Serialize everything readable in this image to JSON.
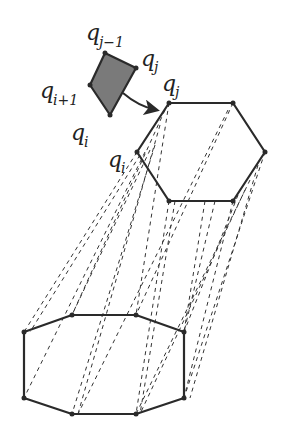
{
  "diagram": {
    "colors": {
      "stroke": "#2a2a2a",
      "fill_quad": "#7a7a7a",
      "background": "#ffffff"
    },
    "labels": {
      "q_j_minus_1": {
        "base": "q",
        "sub": "j−1"
      },
      "q_j_small": {
        "base": "q",
        "sub": "j"
      },
      "q_i_plus_1": {
        "base": "q",
        "sub": "i+1"
      },
      "q_i_small": {
        "base": "q",
        "sub": "i"
      },
      "q_j_hex": {
        "base": "q",
        "sub": "j"
      },
      "q_i_hex": {
        "base": "q",
        "sub": "i"
      }
    },
    "shapes": {
      "quad": [
        [
          105,
          53
        ],
        [
          136,
          68
        ],
        [
          110,
          115
        ],
        [
          90,
          85
        ]
      ],
      "hexagon": [
        [
          169,
          103
        ],
        [
          233,
          103
        ],
        [
          265,
          152
        ],
        [
          233,
          201
        ],
        [
          169,
          201
        ],
        [
          137,
          152
        ]
      ],
      "octagon": [
        [
          24,
          332
        ],
        [
          72,
          315
        ],
        [
          136,
          315
        ],
        [
          184,
          332
        ],
        [
          184,
          398
        ],
        [
          136,
          414
        ],
        [
          72,
          414
        ],
        [
          24,
          398
        ]
      ]
    }
  }
}
